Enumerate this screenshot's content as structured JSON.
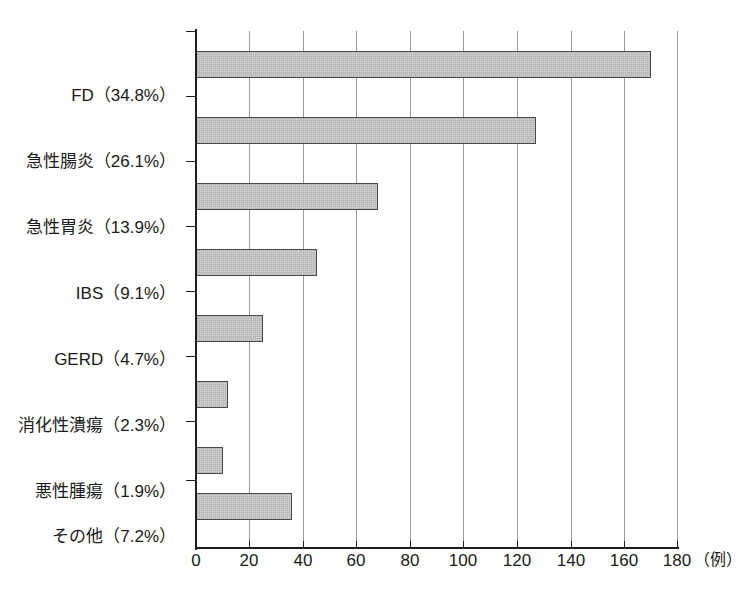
{
  "chart_data": {
    "type": "bar",
    "orientation": "horizontal",
    "title": "",
    "xlabel": "（例）",
    "ylabel": "",
    "xlim": [
      0,
      180
    ],
    "xticks": [
      0,
      20,
      40,
      60,
      80,
      100,
      120,
      140,
      160,
      180
    ],
    "grid": "vertical",
    "legend": "none",
    "categories": [
      "FD（34.8%）",
      "急性腸炎（26.1%）",
      "急性胃炎（13.9%）",
      "IBS（9.1%）",
      "GERD（4.7%）",
      "消化性潰瘍（2.3%）",
      "悪性腫瘍（1.9%）",
      "その他（7.2%）"
    ],
    "values": [
      170,
      127,
      68,
      45,
      25,
      12,
      10,
      36
    ],
    "percents": [
      34.8,
      26.1,
      13.9,
      9.1,
      4.7,
      2.3,
      1.9,
      7.2
    ],
    "bar_fill_color": "#d3d3d3",
    "bar_border_color": "#4a4a4a",
    "axis_color": "#1f1f1f",
    "grid_color": "#9a9a9a"
  }
}
